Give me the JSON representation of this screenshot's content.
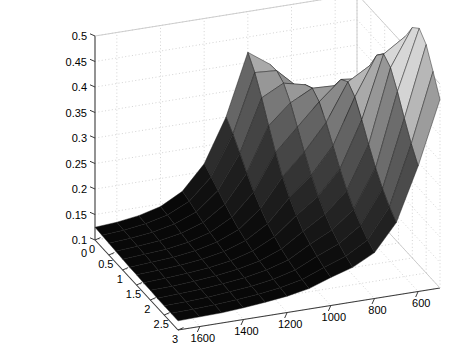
{
  "figure": {
    "background": "#ffffff",
    "width": 454,
    "height": 350
  },
  "chart_data": {
    "type": "surface",
    "title": "",
    "xlabel": "",
    "ylabel": "",
    "zlabel": "",
    "grid": true,
    "legend": "none",
    "colormap": "gray",
    "view": {
      "azimuth": -37.5,
      "elevation": 30
    },
    "x": [
      0,
      0.25,
      0.5,
      0.75,
      1,
      1.25,
      1.5,
      1.75,
      2,
      2.25,
      2.5,
      2.75,
      3
    ],
    "y": [
      1700,
      1600,
      1500,
      1400,
      1300,
      1200,
      1100,
      1000,
      900,
      800,
      700,
      600,
      500
    ],
    "xticks": [
      0,
      0.5,
      1,
      1.5,
      2,
      2.5,
      3
    ],
    "xticklabels": [
      "0",
      "0.5",
      "1",
      "1.5",
      "2",
      "2.5",
      "3"
    ],
    "yticks": [
      1600,
      1400,
      1200,
      1000,
      800,
      600
    ],
    "yticklabels": [
      "1600",
      "1400",
      "1200",
      "1000",
      "800",
      "600"
    ],
    "zticks": [
      0.1,
      0.15,
      0.2,
      0.25,
      0.3,
      0.35,
      0.4,
      0.45,
      0.5
    ],
    "zticklabels": [
      "0.1",
      "0.15",
      "0.2",
      "0.25",
      "0.3",
      "0.35",
      "0.4",
      "0.45",
      "0.5"
    ],
    "origin_label": "0",
    "xlim": [
      0,
      3
    ],
    "ylim": [
      500,
      1700
    ],
    "zlim": [
      0.1,
      0.5
    ],
    "clipped_peak": true,
    "z": [
      [
        0.125,
        0.124,
        0.123,
        0.122,
        0.121,
        0.12,
        0.12,
        0.119,
        0.119,
        0.118,
        0.118,
        0.118,
        0.118
      ],
      [
        0.128,
        0.127,
        0.126,
        0.125,
        0.124,
        0.123,
        0.122,
        0.121,
        0.12,
        0.12,
        0.119,
        0.119,
        0.119
      ],
      [
        0.134,
        0.133,
        0.131,
        0.129,
        0.127,
        0.126,
        0.125,
        0.124,
        0.123,
        0.122,
        0.121,
        0.121,
        0.12
      ],
      [
        0.145,
        0.143,
        0.14,
        0.137,
        0.134,
        0.132,
        0.13,
        0.128,
        0.127,
        0.126,
        0.125,
        0.124,
        0.123
      ],
      [
        0.168,
        0.163,
        0.157,
        0.151,
        0.146,
        0.142,
        0.138,
        0.135,
        0.133,
        0.131,
        0.129,
        0.128,
        0.127
      ],
      [
        0.215,
        0.204,
        0.192,
        0.18,
        0.169,
        0.16,
        0.153,
        0.147,
        0.142,
        0.139,
        0.136,
        0.134,
        0.132
      ],
      [
        0.3,
        0.281,
        0.258,
        0.234,
        0.212,
        0.194,
        0.179,
        0.168,
        0.159,
        0.152,
        0.147,
        0.143,
        0.14
      ],
      [
        0.42,
        0.395,
        0.36,
        0.32,
        0.282,
        0.249,
        0.223,
        0.203,
        0.187,
        0.176,
        0.167,
        0.16,
        0.155
      ],
      [
        0.39,
        0.392,
        0.382,
        0.358,
        0.325,
        0.291,
        0.26,
        0.234,
        0.213,
        0.197,
        0.185,
        0.175,
        0.168
      ],
      [
        0.33,
        0.352,
        0.372,
        0.38,
        0.368,
        0.342,
        0.311,
        0.28,
        0.253,
        0.231,
        0.214,
        0.2,
        0.19
      ],
      [
        0.29,
        0.315,
        0.345,
        0.378,
        0.405,
        0.415,
        0.4,
        0.37,
        0.336,
        0.305,
        0.279,
        0.258,
        0.242
      ],
      [
        0.262,
        0.288,
        0.32,
        0.358,
        0.4,
        0.44,
        0.475,
        0.492,
        0.48,
        0.448,
        0.41,
        0.375,
        0.346
      ],
      [
        0.245,
        0.27,
        0.3,
        0.338,
        0.382,
        0.43,
        0.478,
        0.52,
        0.552,
        0.565,
        0.548,
        0.51,
        0.47
      ]
    ]
  },
  "axes": {
    "axis_line_color": "#3a3a3a",
    "grid_color": "#c8c8c8",
    "tick_color": "#3a3a3a",
    "surface_edge_color": "#1a1a1a"
  }
}
